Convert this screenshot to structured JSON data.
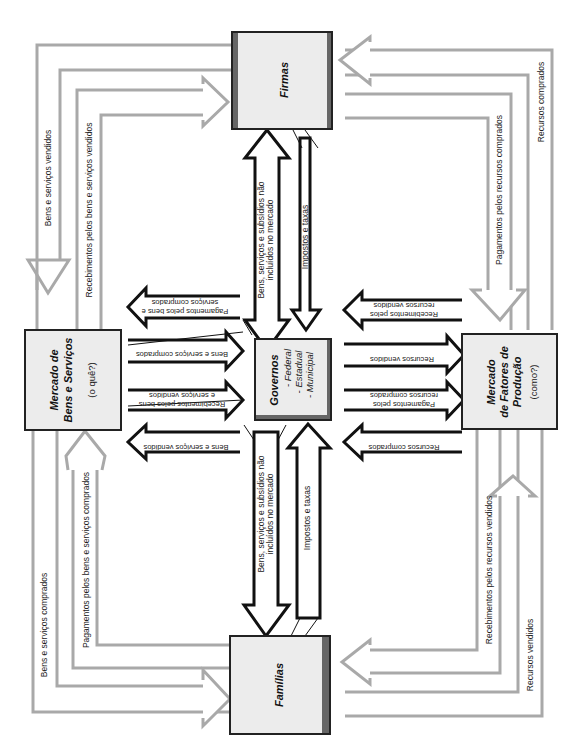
{
  "boxes": {
    "firmas": {
      "title": "Firmas"
    },
    "familias": {
      "title": "Famílias"
    },
    "governos": {
      "title": "Governos",
      "items": [
        "- Federal",
        "- Estadual",
        "- Municipal"
      ]
    },
    "mercado_bens": {
      "title_line1": "Mercado de",
      "title_line2": "Bens e Serviços",
      "subtitle": "(o quê?)"
    },
    "mercado_fatores": {
      "title_line1": "Mercado",
      "title_line2": "de Fatores de",
      "title_line3": "Produção",
      "subtitle": "(como?)"
    }
  },
  "outer_flows": {
    "top_left_outer": "Bens e serviços vendidos",
    "top_left_inner": "Recebimentos pelos bens e serviços vendidos",
    "bottom_left_outer": "Bens e serviços comprados",
    "bottom_left_inner": "Pagamentos pelos bens e serviços comprados",
    "top_right_outer": "Recursos comprados",
    "top_right_inner": "Pagamentos pelos recursos comprados",
    "bottom_right_outer": "Recursos vendidos",
    "bottom_right_inner": "Recebimentos pelos recursos vendidos"
  },
  "government_flows": {
    "firmas_to_gov_1": "Bens, serviços e subsídios não",
    "firmas_to_gov_2": "incluídos no mercado",
    "firmas_taxes": "Impostos e taxas",
    "familias_to_gov_1": "Bens, serviços e subsídios não",
    "familias_to_gov_2": "incluídos no mercado",
    "familias_taxes": "Impostos e taxas",
    "bens_left": [
      {
        "line1": "Pagamentos pelos bens e",
        "line2": "serviços comprados"
      },
      {
        "line1": "Bens e serviços comprados",
        "line2": ""
      },
      {
        "line1": "Recebimentos pelos bens",
        "line2": "e serviços vendidos"
      },
      {
        "line1": "Bens e serviços vendidos",
        "line2": ""
      }
    ],
    "fatores_right": [
      {
        "line1": "Recebimentos pelos",
        "line2": "recursos vendidos"
      },
      {
        "line1": "Recursos vendidos",
        "line2": ""
      },
      {
        "line1": "Pagamentos pelos",
        "line2": "recursos comprados"
      },
      {
        "line1": "Recursos comprados",
        "line2": ""
      }
    ]
  },
  "colors": {
    "outer_flow_gray": "#a9a9a9",
    "box_fill": "#ececec",
    "box_band": "#666666",
    "arrow_black": "#111111"
  }
}
